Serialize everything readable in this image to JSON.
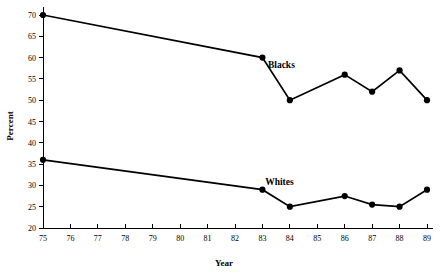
{
  "chart_data": {
    "type": "line",
    "title": "",
    "xlabel": "Year",
    "ylabel": "Percent",
    "xlim": [
      75,
      89
    ],
    "ylim": [
      20,
      70
    ],
    "grid": false,
    "legend_position": "inline-annotation",
    "x": [
      75,
      76,
      77,
      78,
      79,
      80,
      81,
      82,
      83,
      84,
      85,
      86,
      87,
      88,
      89
    ],
    "xticklabels": [
      "75",
      "76",
      "77",
      "78",
      "79",
      "80",
      "81",
      "82",
      "83",
      "84",
      "85",
      "86",
      "87",
      "88",
      "89"
    ],
    "yticks": [
      20,
      25,
      30,
      35,
      40,
      45,
      50,
      55,
      60,
      65,
      70
    ],
    "yticklabels": [
      "20",
      "25",
      "30",
      "35",
      "40",
      "45",
      "50",
      "55",
      "60",
      "65",
      "70"
    ],
    "series": [
      {
        "name": "Blacks",
        "label": "Blacks",
        "color": "#000000",
        "label_x": 83.2,
        "label_y": 57.5,
        "x": [
          75,
          83,
          84,
          86,
          87,
          88,
          89
        ],
        "values": [
          70,
          60,
          50,
          56,
          52,
          57,
          50
        ],
        "markers_at": [
          75,
          83,
          84,
          86,
          87,
          88,
          89
        ]
      },
      {
        "name": "Whites",
        "label": "Whites",
        "color": "#000000",
        "label_x": 83.1,
        "label_y": 30.2,
        "x": [
          75,
          83,
          84,
          86,
          87,
          88,
          89
        ],
        "values": [
          36,
          29,
          25,
          27.5,
          25.5,
          25,
          29
        ],
        "markers_at": [
          75,
          83,
          84,
          86,
          87,
          88,
          89
        ]
      }
    ]
  },
  "axes": {
    "y_title": "Percent",
    "x_title": "Year"
  }
}
